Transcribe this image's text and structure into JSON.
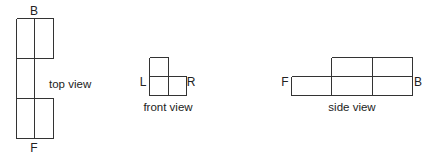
{
  "diagram": {
    "type": "orthographic-projection",
    "line_color": "#333333",
    "text_color": "#222222",
    "views": [
      {
        "id": "top",
        "caption": "top view",
        "caption_pos": {
          "x": 49,
          "y": 88,
          "anchor": "start"
        },
        "labels": [
          {
            "text": "B",
            "x": 34,
            "y": 15,
            "anchor": "middle"
          },
          {
            "text": "F",
            "x": 34,
            "y": 152,
            "anchor": "middle"
          }
        ],
        "lines": [
          [
            16,
            18,
            53,
            18
          ],
          [
            16,
            18,
            16,
            138
          ],
          [
            34,
            18,
            34,
            138
          ],
          [
            53,
            18,
            53,
            58
          ],
          [
            16,
            58,
            53,
            58
          ],
          [
            16,
            98,
            53,
            98
          ],
          [
            53,
            98,
            53,
            138
          ],
          [
            16,
            138,
            53,
            138
          ]
        ]
      },
      {
        "id": "front",
        "caption": "front view",
        "caption_pos": {
          "x": 168,
          "y": 111,
          "anchor": "middle"
        },
        "labels": [
          {
            "text": "L",
            "x": 143,
            "y": 86,
            "anchor": "middle"
          },
          {
            "text": "R",
            "x": 191,
            "y": 86,
            "anchor": "middle"
          }
        ],
        "lines": [
          [
            149,
            57,
            168,
            57
          ],
          [
            149,
            57,
            149,
            95
          ],
          [
            168,
            57,
            168,
            95
          ],
          [
            149,
            76,
            186,
            76
          ],
          [
            186,
            76,
            186,
            95
          ],
          [
            149,
            95,
            186,
            95
          ]
        ]
      },
      {
        "id": "side",
        "caption": "side view",
        "caption_pos": {
          "x": 352,
          "y": 111,
          "anchor": "middle"
        },
        "labels": [
          {
            "text": "F",
            "x": 285,
            "y": 86,
            "anchor": "middle"
          },
          {
            "text": "B",
            "x": 418,
            "y": 86,
            "anchor": "middle"
          }
        ],
        "lines": [
          [
            331,
            57,
            412,
            57
          ],
          [
            331,
            57,
            331,
            95
          ],
          [
            372,
            57,
            372,
            95
          ],
          [
            412,
            57,
            412,
            95
          ],
          [
            291,
            76,
            412,
            76
          ],
          [
            291,
            76,
            291,
            95
          ],
          [
            291,
            95,
            412,
            95
          ]
        ]
      }
    ]
  }
}
